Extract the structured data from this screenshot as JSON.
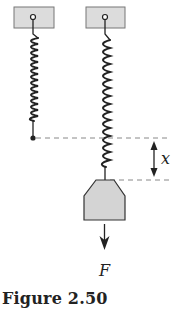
{
  "figure": {
    "caption": "Figure 2.50",
    "labels": {
      "displacement": "x",
      "force": "F"
    },
    "colors": {
      "support_fill": "#dcdcdc",
      "weight_fill": "#d4d4d4",
      "stroke": "#222222",
      "dashed": "#888888"
    },
    "elements": [
      "unstretched spring hanging from support",
      "stretched spring with weight attached",
      "displacement arrow x between dashed reference lines",
      "downward force arrow F"
    ]
  }
}
